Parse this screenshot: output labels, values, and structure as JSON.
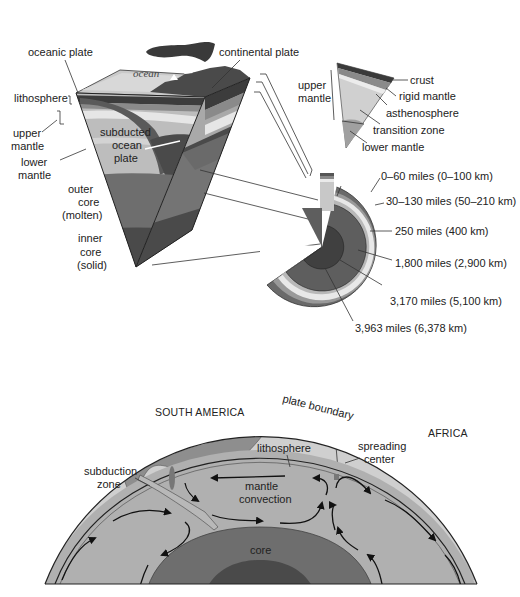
{
  "figure": {
    "type": "earth-structure-diagram",
    "colors": {
      "crust_dark": "#3c3c3c",
      "rigid_mantle": "#8a8a8a",
      "asthenosphere": "#e6e6e6",
      "upper_mantle": "#bdbdbd",
      "transition_zone": "#a8a8a8",
      "lower_mantle": "#9a9a9a",
      "outer_core": "#6e6e6e",
      "inner_core": "#4a4a4a",
      "ocean_surface": "#c9c9c9",
      "continent": "#8c8c8c",
      "globe_surface": "#cfcfcf",
      "background": "#ffffff"
    }
  },
  "block": {
    "labels": {
      "oceanic_plate": "oceanic plate",
      "continental_plate": "continental plate",
      "ocean": "ocean",
      "lithosphere": "lithosphere",
      "upper_mantle_1": "upper",
      "upper_mantle_2": "mantle",
      "lower_mantle_1": "lower",
      "lower_mantle_2": "mantle",
      "subducted_1": "subducted",
      "subducted_2": "ocean",
      "subducted_3": "plate",
      "outer_core_1": "outer",
      "outer_core_2": "core",
      "outer_core_3": "(molten)",
      "inner_core_1": "inner",
      "inner_core_2": "core",
      "inner_core_3": "(solid)"
    }
  },
  "wedge": {
    "labels": {
      "upper_mantle_1": "upper",
      "upper_mantle_2": "mantle",
      "crust": "crust",
      "rigid_mantle": "rigid mantle",
      "asthenosphere": "asthenosphere",
      "transition_zone": "transition zone",
      "lower_mantle": "lower mantle"
    }
  },
  "section": {
    "depths": [
      {
        "label": "0–60 miles (0–100 km)"
      },
      {
        "label": "30–130 miles (50–210 km)"
      },
      {
        "label": "250 miles (400 km)"
      },
      {
        "label": "1,800 miles (2,900 km)"
      },
      {
        "label": "3,170 miles (5,100 km)"
      },
      {
        "label": "3,963 miles (6,378 km)"
      }
    ]
  },
  "globe": {
    "labels": {
      "south_america": "SOUTH AMERICA",
      "africa": "AFRICA",
      "plate_boundary": "plate boundary",
      "lithosphere": "lithosphere",
      "spreading_1": "spreading",
      "spreading_2": "center",
      "subduction_1": "subduction",
      "subduction_2": "zone",
      "mantle_1": "mantle",
      "mantle_2": "convection",
      "core": "core"
    }
  }
}
